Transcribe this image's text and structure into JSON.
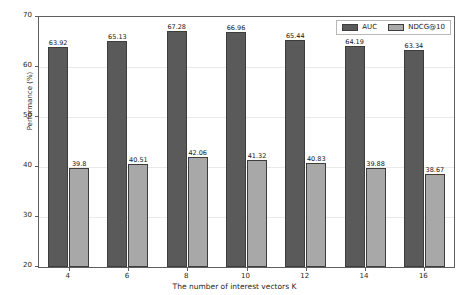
{
  "chart_data": {
    "type": "bar",
    "title": "",
    "xlabel": "The number of interest vectors K",
    "ylabel": "Performance (%)",
    "categories": [
      "4",
      "6",
      "8",
      "10",
      "12",
      "14",
      "16"
    ],
    "ylim": [
      20,
      70
    ],
    "yticks": [
      "20",
      "30",
      "40",
      "50",
      "60",
      "70"
    ],
    "grid": true,
    "legend_position": "upper right",
    "series": [
      {
        "name": "AUC",
        "color": "#5a5a5a",
        "values": [
          63.92,
          65.13,
          67.28,
          66.96,
          65.44,
          64.19,
          63.34
        ],
        "labels": [
          "63.92",
          "65.13",
          "67.28",
          "66.96",
          "65.44",
          "64.19",
          "63.34"
        ]
      },
      {
        "name": "NDCG@10",
        "color": "#a8a8a8",
        "values": [
          39.8,
          40.51,
          42.06,
          41.32,
          40.83,
          39.88,
          38.67
        ],
        "labels": [
          "39.8",
          "40.51",
          "42.06",
          "41.32",
          "40.83",
          "39.88",
          "38.67"
        ]
      }
    ]
  }
}
